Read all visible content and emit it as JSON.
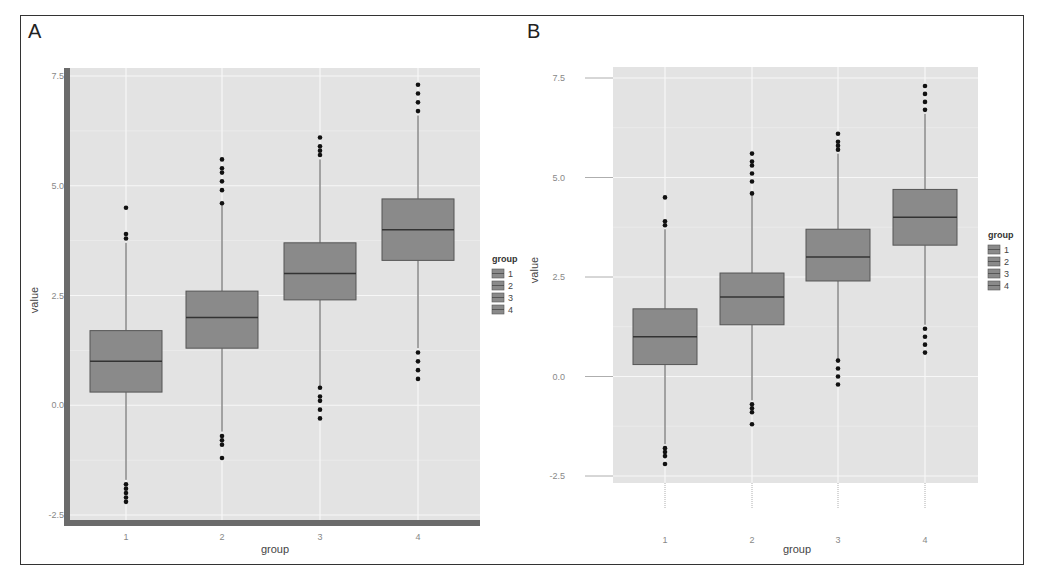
{
  "chart_data": [
    {
      "panel": "A",
      "type": "boxplot",
      "title": "",
      "xlabel": "group",
      "ylabel": "value",
      "categories": [
        "1",
        "2",
        "3",
        "4"
      ],
      "y_ticks": [
        "-2.5",
        "0.0",
        "2.5",
        "5.0",
        "7.5"
      ],
      "ylim": [
        -2.6,
        7.7
      ],
      "grid": true,
      "legend": {
        "title": "group",
        "entries": [
          "1",
          "2",
          "3",
          "4"
        ],
        "position": "right"
      },
      "series": [
        {
          "group": "1",
          "min": -1.7,
          "q1": 0.3,
          "median": 1.0,
          "q3": 1.7,
          "max": 3.7,
          "outliers_high": [
            3.8,
            3.9,
            4.5
          ],
          "outliers_low": [
            -1.8,
            -1.9,
            -2.0,
            -2.1,
            -2.2
          ]
        },
        {
          "group": "2",
          "min": -0.6,
          "q1": 1.3,
          "median": 2.0,
          "q3": 2.6,
          "max": 4.6,
          "outliers_high": [
            4.6,
            4.9,
            5.1,
            5.3,
            5.4,
            5.6
          ],
          "outliers_low": [
            -0.7,
            -0.8,
            -0.9,
            -1.2
          ]
        },
        {
          "group": "3",
          "min": 0.4,
          "q1": 2.4,
          "median": 3.0,
          "q3": 3.7,
          "max": 5.6,
          "outliers_high": [
            5.7,
            5.8,
            5.9,
            6.1
          ],
          "outliers_low": [
            0.4,
            0.2,
            0.1,
            -0.1,
            -0.3
          ]
        },
        {
          "group": "4",
          "min": 1.3,
          "q1": 3.3,
          "median": 4.0,
          "q3": 4.7,
          "max": 6.6,
          "outliers_high": [
            6.7,
            6.9,
            7.1,
            7.3
          ],
          "outliers_low": [
            1.2,
            1.0,
            0.8,
            0.6
          ]
        }
      ]
    },
    {
      "panel": "B",
      "type": "boxplot",
      "title": "",
      "xlabel": "group",
      "ylabel": "value",
      "categories": [
        "1",
        "2",
        "3",
        "4"
      ],
      "y_ticks": [
        "-2.5",
        "0.0",
        "2.5",
        "5.0",
        "7.5"
      ],
      "ylim": [
        -2.7,
        7.8
      ],
      "grid": true,
      "legend": {
        "title": "group",
        "entries": [
          "1",
          "2",
          "3",
          "4"
        ],
        "position": "right"
      },
      "series": [
        {
          "group": "1",
          "min": -1.7,
          "q1": 0.3,
          "median": 1.0,
          "q3": 1.7,
          "max": 3.7,
          "outliers_high": [
            3.8,
            3.9,
            4.5
          ],
          "outliers_low": [
            -1.8,
            -1.9,
            -2.0,
            -2.2
          ]
        },
        {
          "group": "2",
          "min": -0.6,
          "q1": 1.3,
          "median": 2.0,
          "q3": 2.6,
          "max": 4.6,
          "outliers_high": [
            4.6,
            4.9,
            5.1,
            5.3,
            5.4,
            5.6
          ],
          "outliers_low": [
            -0.7,
            -0.8,
            -0.9,
            -1.2
          ]
        },
        {
          "group": "3",
          "min": 0.4,
          "q1": 2.4,
          "median": 3.0,
          "q3": 3.7,
          "max": 5.6,
          "outliers_high": [
            5.7,
            5.8,
            5.9,
            6.1
          ],
          "outliers_low": [
            0.4,
            0.2,
            0.0,
            -0.2
          ]
        },
        {
          "group": "4",
          "min": 1.3,
          "q1": 3.3,
          "median": 4.0,
          "q3": 4.7,
          "max": 6.6,
          "outliers_high": [
            6.7,
            6.9,
            7.1,
            7.3
          ],
          "outliers_low": [
            1.2,
            1.0,
            0.8,
            0.6
          ]
        }
      ]
    }
  ],
  "panels": {
    "A": {
      "label": "A"
    },
    "B": {
      "label": "B"
    }
  },
  "colors": {
    "panel_bg": "#e3e3e3",
    "grid": "#f7f7f7",
    "box_fill": "#8a8a8a",
    "box_stroke": "#555555",
    "median": "#333333",
    "whisker": "#555555",
    "outlier": "#111111",
    "axis_frame_A": "#6b6b6b",
    "tick_text": "#888888"
  }
}
